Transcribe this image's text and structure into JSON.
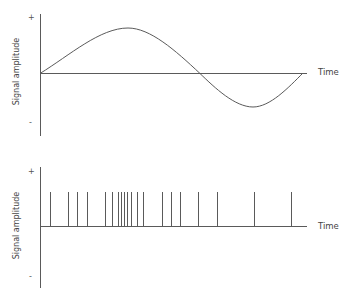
{
  "chart_data": [
    {
      "type": "line",
      "title": "",
      "xlabel": "Time",
      "ylabel": "Signal amplitude",
      "y_tick_labels": [
        "+",
        "-"
      ],
      "description": "Continuous analog signal: one smooth sinusoid-like cycle starting at zero, rising to a positive peak, crossing zero and dipping to a smaller negative trough, then returning to zero",
      "x": [
        0,
        0.33,
        0.6,
        0.8,
        1.0
      ],
      "values": [
        0,
        1.0,
        0,
        -0.75,
        0
      ],
      "grid": false,
      "legend": null
    },
    {
      "type": "scatter",
      "title": "",
      "xlabel": "Time",
      "ylabel": "Signal amplitude",
      "y_tick_labels": [
        "+",
        "-"
      ],
      "description": "Spike train: equal-height vertical spikes whose density increases toward the middle then becomes sparse",
      "spike_positions_px": [
        50,
        68,
        77,
        87,
        105,
        112,
        118,
        121,
        124,
        127,
        131,
        137,
        143,
        162,
        171,
        180,
        198,
        217,
        254,
        291
      ],
      "spike_height": 1,
      "grid": false,
      "legend": null
    }
  ],
  "top": {
    "ylabel": "Signal amplitude",
    "plus": "+",
    "minus": "-",
    "xlabel": "Time"
  },
  "bottom": {
    "ylabel": "Signal amplitude",
    "plus": "+",
    "minus": "-",
    "xlabel": "Time"
  },
  "colors": {
    "axis": "#555555",
    "curve": "#555555"
  }
}
